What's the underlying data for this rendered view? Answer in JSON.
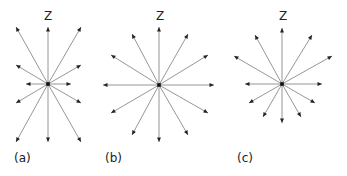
{
  "diagrams": [
    {
      "id": "a",
      "label": "(a)",
      "axis_label": "Z",
      "center": [
        48,
        84
      ],
      "label_pos": [
        14,
        162
      ],
      "axis_label_pos": [
        48,
        20
      ],
      "tips": [
        [
          48,
          27
        ],
        [
          16,
          27
        ],
        [
          81,
          27
        ],
        [
          16,
          65
        ],
        [
          81,
          65
        ],
        [
          26,
          84
        ],
        [
          71,
          84
        ],
        [
          16,
          103
        ],
        [
          81,
          103
        ],
        [
          16,
          142
        ],
        [
          48,
          142
        ],
        [
          81,
          142
        ]
      ]
    },
    {
      "id": "b",
      "label": "(b)",
      "axis_label": "Z",
      "center": [
        159,
        85
      ],
      "label_pos": [
        105,
        162
      ],
      "axis_label_pos": [
        160,
        20
      ],
      "tips": [
        [
          159,
          27
        ],
        [
          132,
          34
        ],
        [
          188,
          34
        ],
        [
          111,
          55
        ],
        [
          208,
          55
        ],
        [
          103,
          85
        ],
        [
          214,
          85
        ],
        [
          111,
          113
        ],
        [
          208,
          113
        ],
        [
          132,
          135
        ],
        [
          188,
          135
        ],
        [
          159,
          142
        ]
      ]
    },
    {
      "id": "c",
      "label": "(c)",
      "axis_label": "Z",
      "center": [
        282,
        84
      ],
      "label_pos": [
        237,
        162
      ],
      "axis_label_pos": [
        283,
        20
      ],
      "tips": [
        [
          282,
          28
        ],
        [
          255,
          35
        ],
        [
          312,
          35
        ],
        [
          234,
          56
        ],
        [
          332,
          56
        ],
        [
          245,
          84
        ],
        [
          322,
          84
        ],
        [
          249,
          103
        ],
        [
          315,
          103
        ],
        [
          263,
          117
        ],
        [
          301,
          117
        ],
        [
          282,
          123
        ]
      ]
    }
  ],
  "colors": {
    "ray": "#8a8a8a",
    "arrowhead": "#222222",
    "text": "#222222",
    "background": "#ffffff"
  }
}
